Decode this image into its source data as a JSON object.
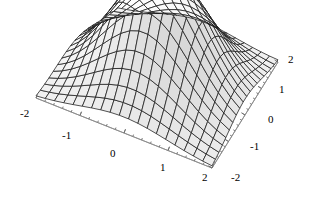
{
  "figure": {
    "background_color": "#ffffff",
    "width": 309,
    "height": 197,
    "title": "",
    "style": "wireframe-mesh-shaded-3d-surface"
  },
  "chart_data": {
    "type": "surface",
    "title": "",
    "xlabel": "",
    "ylabel": "",
    "zlabel": "",
    "function": "gaussian bump: z = exp(-(x^2 + y^2)/2)",
    "xlim": [
      -2,
      2
    ],
    "ylim": [
      -2,
      2
    ],
    "zlim": [
      0,
      1
    ],
    "grid": true,
    "legend": null,
    "colormap": "grayscale",
    "mesh_n": 20,
    "x_ticks": [
      -2,
      -1,
      0,
      1,
      2
    ],
    "y_ticks": [
      -2,
      -1,
      0,
      1,
      2
    ],
    "x_tick_labels": [
      "-2",
      "-1",
      "0",
      "1",
      "2"
    ],
    "y_tick_labels": [
      "2",
      "1",
      "0",
      "-1",
      "-2"
    ],
    "minor_ticks_per_interval": 4,
    "x": [
      -2,
      -1.7894736842,
      -1.5789473684,
      -1.3684210526,
      -1.1578947368,
      -0.9473684211,
      -0.7368421053,
      -0.5263157895,
      -0.3157894737,
      -0.1052631579,
      0.1052631579,
      0.3157894737,
      0.5263157895,
      0.7368421053,
      0.9473684211,
      1.1578947368,
      1.3684210526,
      1.5789473684,
      1.7894736842,
      2
    ],
    "y": [
      -2,
      -1.7894736842,
      -1.5789473684,
      -1.3684210526,
      -1.1578947368,
      -0.9473684211,
      -0.7368421053,
      -0.5263157895,
      -0.3157894737,
      -0.1052631579,
      0.1052631579,
      0.3157894737,
      0.5263157895,
      0.7368421053,
      0.9473684211,
      1.1578947368,
      1.3684210526,
      1.5789473684,
      1.7894736842,
      2
    ],
    "z_note": "z[i][j] = exp(-(x[j]^2 + y[i]^2)/2), peak value 1.0 at (0,0), corner value ~0.018",
    "peak_value": 1.0,
    "corner_value": 0.0183
  },
  "axes": {
    "left_axis": {
      "name": "x-axis",
      "tick_labels": [
        "-2",
        "-1",
        "0",
        "1",
        "2"
      ],
      "label_positions": [
        {
          "text": "-2",
          "left": 20,
          "top": 108
        },
        {
          "text": "-1",
          "left": 62,
          "top": 130
        },
        {
          "text": "0",
          "left": 110,
          "top": 148
        },
        {
          "text": "1",
          "left": 160,
          "top": 162
        },
        {
          "text": "2",
          "left": 202,
          "top": 172
        }
      ]
    },
    "right_axis": {
      "name": "y-axis",
      "tick_labels": [
        "2",
        "1",
        "0",
        "-1",
        "-2"
      ],
      "label_positions": [
        {
          "text": "2",
          "left": 288,
          "top": 54
        },
        {
          "text": "1",
          "left": 279,
          "top": 84
        },
        {
          "text": "0",
          "left": 268,
          "top": 114
        },
        {
          "text": "-1",
          "left": 250,
          "top": 141
        },
        {
          "text": "-2",
          "left": 231,
          "top": 172
        }
      ]
    }
  },
  "geometry": {
    "corner_left": {
      "x": 36,
      "y": 98
    },
    "corner_front": {
      "x": 212,
      "y": 168
    },
    "corner_right": {
      "x": 278,
      "y": 62
    },
    "corner_back": {
      "x": 118,
      "y": 10
    },
    "peak_screen": {
      "x": 160,
      "y": 14
    }
  },
  "colors": {
    "mesh_line": "#1a1a1a",
    "axis_line": "#8c8c8c",
    "tick_mark": "#6e6e6e",
    "surface_light": "#ffffff",
    "surface_dark": "#5a5a5a",
    "text": "#000000",
    "background": "#ffffff"
  }
}
